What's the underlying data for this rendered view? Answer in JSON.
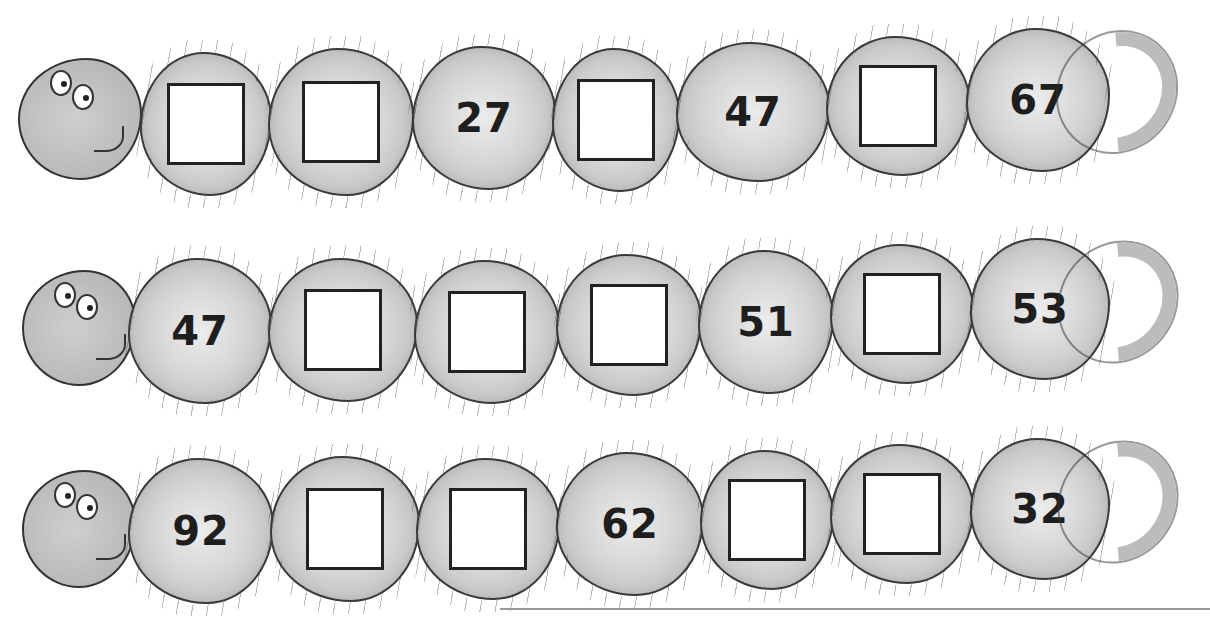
{
  "worksheet": {
    "caterpillars": [
      {
        "segments": [
          {
            "type": "box",
            "value": ""
          },
          {
            "type": "box",
            "value": ""
          },
          {
            "type": "number",
            "value": "27"
          },
          {
            "type": "box",
            "value": ""
          },
          {
            "type": "number",
            "value": "47"
          },
          {
            "type": "box",
            "value": ""
          },
          {
            "type": "number",
            "value": "67"
          }
        ]
      },
      {
        "segments": [
          {
            "type": "number",
            "value": "47"
          },
          {
            "type": "box",
            "value": ""
          },
          {
            "type": "box",
            "value": ""
          },
          {
            "type": "box",
            "value": ""
          },
          {
            "type": "number",
            "value": "51"
          },
          {
            "type": "box",
            "value": ""
          },
          {
            "type": "number",
            "value": "53"
          }
        ]
      },
      {
        "segments": [
          {
            "type": "number",
            "value": "92"
          },
          {
            "type": "box",
            "value": ""
          },
          {
            "type": "box",
            "value": ""
          },
          {
            "type": "number",
            "value": "62"
          },
          {
            "type": "box",
            "value": ""
          },
          {
            "type": "box",
            "value": ""
          },
          {
            "type": "number",
            "value": "32"
          }
        ]
      }
    ]
  },
  "icons": {
    "caterpillar_head": "caterpillar-head-icon",
    "caterpillar_tail": "caterpillar-tail-icon"
  },
  "colors": {
    "segment_fill": "#c8c8c8",
    "outline": "#333333",
    "box_fill": "#ffffff",
    "number_text": "#1e1e1e"
  }
}
